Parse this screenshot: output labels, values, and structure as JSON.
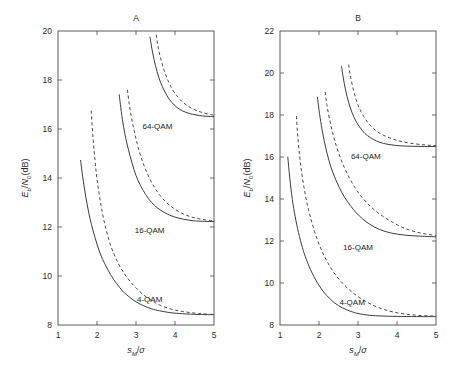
{
  "figure": {
    "background": "#ffffff",
    "line_color": "#3c3c3c",
    "axis_color": "#4a4a4a"
  },
  "chart_data": [
    {
      "type": "line",
      "title": "A",
      "xlabel": "s_M/σ",
      "ylabel": "E_b/N_0(dB)",
      "xlim": [
        1,
        5
      ],
      "ylim": [
        8,
        20
      ],
      "xticks": [
        1,
        2,
        3,
        4,
        5
      ],
      "xticklabels": [
        "1",
        "2",
        "3",
        "4",
        "5"
      ],
      "yticks": [
        8,
        10,
        12,
        14,
        16,
        18,
        20
      ],
      "yticklabels": [
        "8",
        "10",
        "12",
        "14",
        "16",
        "18",
        "20"
      ],
      "grid": false,
      "legend": "none",
      "annotations": [
        {
          "text": "64-QAM",
          "x": 3.55,
          "y": 16.0
        },
        {
          "text": "16-QAM",
          "x": 3.35,
          "y": 11.75
        },
        {
          "text": "4-QAM",
          "x": 3.35,
          "y": 8.95
        }
      ],
      "series": [
        {
          "name": "4-QAM solid",
          "style": "solid",
          "asymptote": 8.4,
          "x": [
            1.58,
            1.62,
            1.68,
            1.75,
            1.82,
            1.9,
            2.0,
            2.1,
            2.2,
            2.35,
            2.5,
            2.65,
            2.8,
            3.0,
            3.2,
            3.4,
            3.6,
            3.9,
            4.2,
            4.6,
            5.0
          ],
          "y": [
            14.72,
            14.2,
            13.55,
            12.9,
            12.35,
            11.85,
            11.3,
            10.85,
            10.5,
            10.05,
            9.7,
            9.4,
            9.18,
            8.95,
            8.78,
            8.66,
            8.58,
            8.5,
            8.46,
            8.43,
            8.42
          ]
        },
        {
          "name": "4-QAM dashed",
          "style": "dashed",
          "asymptote": 8.4,
          "x": [
            1.85,
            1.9,
            1.95,
            2.0,
            2.08,
            2.18,
            2.3,
            2.42,
            2.55,
            2.7,
            2.85,
            3.0,
            3.2,
            3.4,
            3.6,
            3.9,
            4.2,
            4.6,
            5.0
          ],
          "y": [
            16.75,
            15.6,
            14.7,
            13.95,
            13.1,
            12.25,
            11.5,
            10.95,
            10.5,
            10.1,
            9.78,
            9.52,
            9.22,
            9.0,
            8.82,
            8.65,
            8.55,
            8.47,
            8.43
          ]
        },
        {
          "name": "16-QAM solid",
          "style": "solid",
          "asymptote": 12.2,
          "x": [
            2.57,
            2.6,
            2.65,
            2.72,
            2.8,
            2.9,
            3.0,
            3.12,
            3.25,
            3.4,
            3.55,
            3.72,
            3.9,
            4.1,
            4.35,
            4.6,
            5.0
          ],
          "y": [
            17.4,
            17.0,
            16.4,
            15.75,
            15.2,
            14.6,
            14.1,
            13.68,
            13.32,
            13.0,
            12.78,
            12.6,
            12.46,
            12.36,
            12.28,
            12.24,
            12.22
          ]
        },
        {
          "name": "16-QAM dashed",
          "style": "dashed",
          "asymptote": 12.2,
          "x": [
            2.78,
            2.82,
            2.88,
            2.95,
            3.03,
            3.12,
            3.22,
            3.35,
            3.48,
            3.62,
            3.78,
            3.95,
            4.15,
            4.38,
            4.65,
            5.0
          ],
          "y": [
            17.6,
            17.1,
            16.5,
            15.95,
            15.4,
            14.9,
            14.45,
            13.98,
            13.6,
            13.28,
            13.0,
            12.78,
            12.58,
            12.43,
            12.32,
            12.25
          ]
        },
        {
          "name": "64-QAM solid",
          "style": "solid",
          "asymptote": 16.5,
          "x": [
            3.36,
            3.4,
            3.46,
            3.54,
            3.63,
            3.73,
            3.85,
            3.98,
            4.12,
            4.28,
            4.45,
            4.62,
            4.8,
            5.0
          ],
          "y": [
            19.75,
            19.35,
            18.85,
            18.35,
            17.9,
            17.55,
            17.22,
            16.98,
            16.8,
            16.68,
            16.6,
            16.55,
            16.52,
            16.5
          ]
        },
        {
          "name": "64-QAM dashed",
          "style": "dashed",
          "asymptote": 16.5,
          "x": [
            3.52,
            3.56,
            3.63,
            3.72,
            3.82,
            3.93,
            4.05,
            4.18,
            4.32,
            4.48,
            4.65,
            4.82,
            5.0
          ],
          "y": [
            19.85,
            19.4,
            18.9,
            18.4,
            17.98,
            17.62,
            17.35,
            17.12,
            16.95,
            16.8,
            16.7,
            16.62,
            16.56
          ]
        }
      ]
    },
    {
      "type": "line",
      "title": "B",
      "xlabel": "s_M/σ",
      "ylabel": "E_b/N_0(dB)",
      "xlim": [
        1,
        5
      ],
      "ylim": [
        8,
        22
      ],
      "xticks": [
        1,
        2,
        3,
        4,
        5
      ],
      "xticklabels": [
        "1",
        "2",
        "3",
        "4",
        "5"
      ],
      "yticks": [
        8,
        10,
        12,
        14,
        16,
        18,
        20,
        22
      ],
      "yticklabels": [
        "8",
        "10",
        "12",
        "14",
        "16",
        "18",
        "20",
        "22"
      ],
      "grid": false,
      "legend": "none",
      "annotations": [
        {
          "text": "64-QAM",
          "x": 3.2,
          "y": 15.9
        },
        {
          "text": "16-QAM",
          "x": 3.0,
          "y": 11.55
        },
        {
          "text": "4-QAM",
          "x": 2.85,
          "y": 8.95
        }
      ],
      "series": [
        {
          "name": "4-QAM solid",
          "style": "solid",
          "asymptote": 8.4,
          "x": [
            1.2,
            1.24,
            1.3,
            1.37,
            1.45,
            1.55,
            1.65,
            1.78,
            1.9,
            2.05,
            2.2,
            2.4,
            2.6,
            2.8,
            3.0,
            3.3,
            3.6,
            4.0,
            4.5,
            5.0
          ],
          "y": [
            16.0,
            15.2,
            14.2,
            13.35,
            12.6,
            11.85,
            11.25,
            10.65,
            10.2,
            9.75,
            9.4,
            9.05,
            8.82,
            8.66,
            8.55,
            8.46,
            8.43,
            8.41,
            8.4,
            8.4
          ]
        },
        {
          "name": "4-QAM dashed",
          "style": "dashed",
          "asymptote": 8.4,
          "x": [
            1.42,
            1.45,
            1.5,
            1.56,
            1.64,
            1.73,
            1.83,
            1.95,
            2.08,
            2.22,
            2.38,
            2.55,
            2.75,
            2.95,
            3.2,
            3.5,
            3.9,
            4.4,
            5.0
          ],
          "y": [
            17.95,
            17.1,
            16.1,
            15.2,
            14.3,
            13.5,
            12.8,
            12.1,
            11.5,
            10.98,
            10.5,
            10.1,
            9.72,
            9.42,
            9.12,
            8.85,
            8.62,
            8.48,
            8.42
          ]
        },
        {
          "name": "16-QAM solid",
          "style": "solid",
          "asymptote": 12.2,
          "x": [
            1.96,
            2.0,
            2.06,
            2.13,
            2.21,
            2.3,
            2.4,
            2.52,
            2.65,
            2.8,
            2.95,
            3.12,
            3.3,
            3.55,
            3.85,
            4.2,
            4.6,
            5.0
          ],
          "y": [
            18.85,
            18.25,
            17.5,
            16.8,
            16.15,
            15.55,
            15.05,
            14.55,
            14.1,
            13.7,
            13.35,
            13.05,
            12.8,
            12.55,
            12.38,
            12.28,
            12.23,
            12.2
          ]
        },
        {
          "name": "16-QAM dashed",
          "style": "dashed",
          "asymptote": 12.2,
          "x": [
            2.16,
            2.2,
            2.27,
            2.35,
            2.44,
            2.54,
            2.65,
            2.78,
            2.92,
            3.07,
            3.24,
            3.42,
            3.62,
            3.88,
            4.2,
            4.6,
            5.0
          ],
          "y": [
            19.1,
            18.5,
            17.8,
            17.15,
            16.55,
            16.0,
            15.5,
            15.0,
            14.55,
            14.15,
            13.8,
            13.48,
            13.2,
            12.9,
            12.6,
            12.38,
            12.26
          ]
        },
        {
          "name": "64-QAM solid",
          "style": "solid",
          "asymptote": 16.5,
          "x": [
            2.58,
            2.62,
            2.68,
            2.76,
            2.85,
            2.95,
            3.06,
            3.18,
            3.32,
            3.48,
            3.65,
            3.85,
            4.1,
            4.4,
            4.7,
            5.0
          ],
          "y": [
            20.3,
            19.8,
            19.2,
            18.6,
            18.1,
            17.7,
            17.38,
            17.12,
            16.92,
            16.76,
            16.65,
            16.58,
            16.53,
            16.51,
            16.5,
            16.5
          ]
        },
        {
          "name": "64-QAM dashed",
          "style": "dashed",
          "asymptote": 16.5,
          "x": [
            2.76,
            2.8,
            2.87,
            2.95,
            3.04,
            3.15,
            3.27,
            3.4,
            3.55,
            3.72,
            3.92,
            4.15,
            4.45,
            4.75,
            5.0
          ],
          "y": [
            20.4,
            19.9,
            19.3,
            18.75,
            18.3,
            17.92,
            17.6,
            17.35,
            17.14,
            16.98,
            16.84,
            16.72,
            16.63,
            16.57,
            16.54
          ]
        }
      ]
    }
  ]
}
